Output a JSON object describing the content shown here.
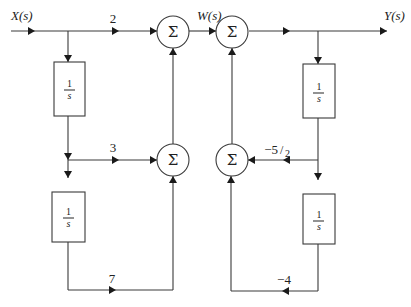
{
  "diagram": {
    "type": "block-diagram",
    "signals": {
      "input": "X(s)",
      "intermediate": "W(s)",
      "output": "Y(s)"
    },
    "summing_junction_symbol": "Σ",
    "integrator_blocks": [
      {
        "id": "left-top",
        "numerator": "1",
        "denominator": "s"
      },
      {
        "id": "left-bottom",
        "numerator": "1",
        "denominator": "s"
      },
      {
        "id": "right-top",
        "numerator": "1",
        "denominator": "s"
      },
      {
        "id": "right-bottom",
        "numerator": "1",
        "denominator": "s"
      }
    ],
    "gains": {
      "forward_top": "2",
      "forward_middle": "3",
      "forward_bottom": "7",
      "feedback_middle_prefix": "−5",
      "feedback_middle_denominator": "2",
      "feedback_bottom": "−4"
    }
  }
}
